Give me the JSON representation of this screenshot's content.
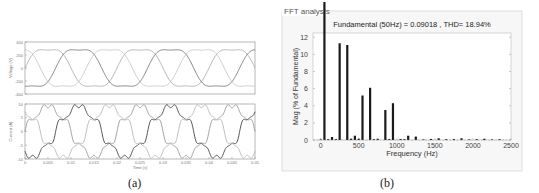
{
  "chart_data": [
    {
      "panel": "a",
      "type": "line",
      "caption": "(a)",
      "subplots": [
        {
          "name": "voltage",
          "ylabel": "Voltage (V)",
          "ylim": [
            -400,
            400
          ],
          "yticks": [
            "400",
            "200",
            "0",
            "-200",
            "-400"
          ],
          "ytick_values": [
            400,
            200,
            0,
            -200,
            -400
          ],
          "amplitude": 330,
          "frequency_hz": 50,
          "phases_deg": [
            0,
            -120,
            120
          ],
          "series_colors": [
            "#9a9a9a",
            "#555555",
            "#b8b8b8"
          ]
        },
        {
          "name": "current",
          "ylabel": "Current (A)",
          "ylim": [
            -10,
            10
          ],
          "yticks": [
            "10",
            "5",
            "0",
            "-5",
            "-10"
          ],
          "ytick_values": [
            10,
            5,
            0,
            -5,
            -10
          ],
          "amplitude": 9,
          "frequency_hz": 50,
          "phases_deg": [
            0,
            -120,
            120
          ],
          "series_colors": [
            "#9a9a9a",
            "#444444",
            "#b8b8b8"
          ]
        }
      ],
      "xlabel": "Time (s)",
      "xlim": [
        0,
        0.05
      ],
      "xticks": [
        "0",
        "0.005",
        "0.01",
        "0.015",
        "0.02",
        "0.025",
        "0.03",
        "0.035",
        "0.04",
        "0.045",
        "0.05"
      ],
      "xtick_values": [
        0,
        0.005,
        0.01,
        0.015,
        0.02,
        0.025,
        0.03,
        0.035,
        0.04,
        0.045,
        0.05
      ]
    },
    {
      "panel": "b",
      "type": "bar",
      "caption": "(b)",
      "frame_title": "FFT analysis",
      "title": "Fundamental (50Hz) = 0.09018 , THD= 18.94%",
      "xlabel": "Frequency (Hz)",
      "ylabel": "Mag (% of Fundamental)",
      "xlim": [
        -100,
        2500
      ],
      "ylim": [
        0,
        12.5
      ],
      "xticks": [
        "0",
        "500",
        "1000",
        "1500",
        "2000",
        "2500"
      ],
      "xtick_values": [
        0,
        500,
        1000,
        1500,
        2000,
        2500
      ],
      "yticks": [
        "0",
        "2",
        "4",
        "6",
        "8",
        "10",
        "12"
      ],
      "ytick_values": [
        0,
        2,
        4,
        6,
        8,
        10,
        12
      ],
      "grid": false,
      "bar_color": "#1a1a1a",
      "x": [
        0,
        50,
        100,
        150,
        200,
        250,
        350,
        400,
        450,
        500,
        550,
        650,
        700,
        750,
        850,
        900,
        950,
        1050,
        1100,
        1150,
        1250,
        1350,
        1450,
        1550,
        1650,
        1750,
        1850,
        1950,
        2050,
        2150,
        2250,
        2350
      ],
      "values": [
        0.05,
        100,
        0.1,
        0.35,
        0.1,
        11.3,
        11.1,
        0.15,
        0.5,
        0.15,
        5.2,
        6.1,
        0.1,
        0.15,
        3.5,
        0.1,
        4.3,
        0.12,
        0.1,
        0.5,
        0.4,
        0.05,
        0.12,
        0.2,
        0.1,
        0.12,
        0.2,
        0.05,
        0.1,
        0.15,
        0.05,
        0.1
      ]
    }
  ]
}
